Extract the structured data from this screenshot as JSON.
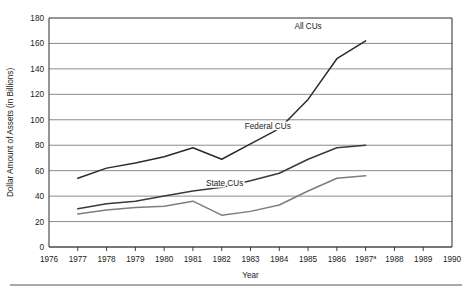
{
  "chart_data": {
    "type": "line",
    "title": "",
    "xlabel": "Year",
    "ylabel": "Dollar Amount of Assets (in Billions)",
    "x": [
      1977,
      1978,
      1979,
      1980,
      1981,
      1982,
      1983,
      1984,
      1985,
      1986,
      1987
    ],
    "xlim": [
      1976,
      1990
    ],
    "ylim": [
      0,
      180
    ],
    "xticks": [
      "1976",
      "1977",
      "1978",
      "1979",
      "1980",
      "1981",
      "1982",
      "1983",
      "1984",
      "1985",
      "1986",
      "1987",
      "1988",
      "1989",
      "1990"
    ],
    "xtick_superscripts": {
      "1987": "a"
    },
    "yticks": [
      "0",
      "20",
      "40",
      "60",
      "80",
      "100",
      "120",
      "140",
      "160",
      "180"
    ],
    "grid": "horizontal",
    "legend_position": "inline-annotations",
    "series": [
      {
        "name": "All CUs",
        "color": "#2b2b2b",
        "values": [
          54,
          62,
          66,
          71,
          78,
          69,
          81,
          93,
          116,
          148,
          162
        ],
        "label_x": 1985.0,
        "label_y": 171
      },
      {
        "name": "Federal CUs",
        "color": "#3a3a3a",
        "values": [
          30,
          34,
          36,
          40,
          44,
          47,
          52,
          58,
          69,
          78,
          80
        ],
        "label_x": 1983.6,
        "label_y": 93
      },
      {
        "name": "State CUs",
        "color": "#7d7d7d",
        "values": [
          26,
          29,
          31,
          32,
          36,
          25,
          28,
          33,
          44,
          54,
          56
        ],
        "label_x": 1982.1,
        "label_y": 48
      }
    ]
  },
  "figure": {
    "footer_rule": true
  }
}
